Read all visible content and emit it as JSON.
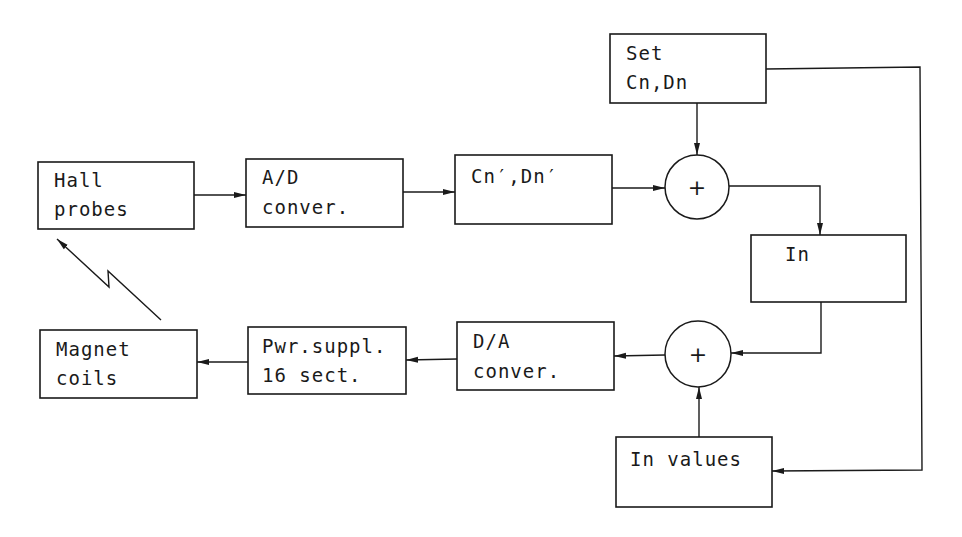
{
  "diagram": {
    "type": "block-diagram",
    "blocks": {
      "hall_probes": {
        "line1": "Hall",
        "line2": "probes"
      },
      "ad_converter": {
        "line1": "A/D",
        "line2": "conver."
      },
      "cn_dn_prime": {
        "line1": "Cn′,Dn′"
      },
      "set_cn_dn": {
        "line1": "Set",
        "line2": "Cn,Dn"
      },
      "in_block": {
        "line1": "In"
      },
      "da_converter": {
        "line1": "D/A",
        "line2": "conver."
      },
      "power_supply": {
        "line1": "Pwr.suppl.",
        "line2": "16 sect."
      },
      "magnet_coils": {
        "line1": "Magnet",
        "line2": "coils"
      },
      "in_values": {
        "line1": "In values"
      }
    },
    "summing_junctions": {
      "upper": {
        "symbol": "+"
      },
      "lower": {
        "symbol": "+"
      }
    },
    "connections": [
      {
        "from": "Hall probes",
        "to": "A/D conver."
      },
      {
        "from": "A/D conver.",
        "to": "Cn′,Dn′"
      },
      {
        "from": "Cn′,Dn′",
        "to": "upper sum"
      },
      {
        "from": "Set Cn,Dn",
        "to": "upper sum"
      },
      {
        "from": "upper sum",
        "to": "In"
      },
      {
        "from": "In",
        "to": "lower sum"
      },
      {
        "from": "In values",
        "to": "lower sum"
      },
      {
        "from": "Set Cn,Dn",
        "to": "In values"
      },
      {
        "from": "lower sum",
        "to": "D/A conver."
      },
      {
        "from": "D/A conver.",
        "to": "Pwr.suppl. 16 sect."
      },
      {
        "from": "Pwr.suppl. 16 sect.",
        "to": "Magnet coils"
      },
      {
        "from": "Magnet coils",
        "to": "Hall probes",
        "style": "field-coupling"
      }
    ]
  }
}
